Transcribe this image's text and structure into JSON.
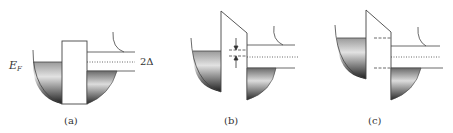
{
  "figure": {
    "panels": [
      {
        "id": "a",
        "caption": "(a)",
        "description": "Equilibrium: rectangular tunnel barrier between two superconductors; Fermi levels aligned"
      },
      {
        "id": "b",
        "caption": "(b)",
        "description": "Small bias: tilted barrier; Fermi levels shifted, arrows indicating shift"
      },
      {
        "id": "c",
        "caption": "(c)",
        "description": "Bias eV = Δ: filled states of left align with gap edge on right"
      }
    ],
    "labels": {
      "fermi_level": "E",
      "fermi_subscript": "F",
      "gap": "2Δ"
    },
    "colors": {
      "line": "#444444",
      "fill_dark": "#2a2a2a",
      "fill_light": "#e6e6e6",
      "background": "#ffffff"
    }
  }
}
